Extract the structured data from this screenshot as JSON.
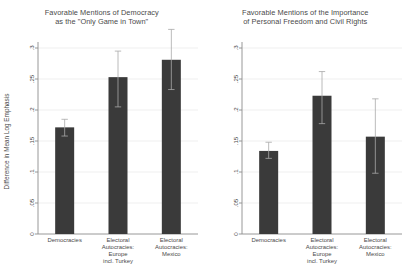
{
  "figure": {
    "background": "#ffffff",
    "bar_color": "#3a3a3a",
    "axis_color": "#8c8c8c",
    "grid_color": "#e8e8e8",
    "error_bar_color": "#a8a8a8"
  },
  "chart_data": [
    {
      "type": "bar",
      "title": "Favorable Mentions of Democracy\nas the \"Only Game in Town\"",
      "xlabel": "",
      "ylabel": "Difference in Mean Log Emphasis",
      "ylim": [
        0,
        0.3
      ],
      "yticks": [
        0,
        0.05,
        0.1,
        0.15,
        0.2,
        0.25,
        0.3
      ],
      "ytick_labels": [
        "0",
        ".05",
        ".1",
        ".15",
        ".2",
        ".25",
        ".3"
      ],
      "grid": true,
      "legend": "none",
      "categories": [
        "Democracies",
        "Electoral\nAutocracies:\nEurope\nincl. Turkey",
        "Electoral\nAutocracies:\nMexico"
      ],
      "values": [
        0.172,
        0.253,
        0.281
      ],
      "error_low": [
        0.158,
        0.205,
        0.233
      ],
      "error_high": [
        0.185,
        0.295,
        0.33
      ]
    },
    {
      "type": "bar",
      "title": "Favorable Mentions of the Importance\nof Personal Freedom and Civil Rights",
      "xlabel": "",
      "ylabel": "",
      "ylim": [
        0,
        0.3
      ],
      "yticks": [
        0,
        0.05,
        0.1,
        0.15,
        0.2,
        0.25,
        0.3
      ],
      "ytick_labels": [
        "0",
        ".05",
        ".1",
        ".15",
        ".2",
        ".25",
        ".3"
      ],
      "grid": true,
      "legend": "none",
      "categories": [
        "Democracies",
        "Electoral\nAutocracies:\nEurope\nincl. Turkey",
        "Electoral\nAutocracies:\nMexico"
      ],
      "values": [
        0.134,
        0.223,
        0.157
      ],
      "error_low": [
        0.122,
        0.178,
        0.098
      ],
      "error_high": [
        0.148,
        0.262,
        0.218
      ]
    }
  ]
}
